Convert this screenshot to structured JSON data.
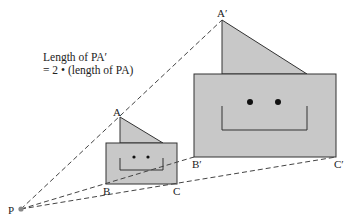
{
  "caption": {
    "line1": "Length of PA′",
    "line2": "= 2 • (length of PA)"
  },
  "labels": {
    "P": "P",
    "A": "A",
    "B": "B",
    "C": "C",
    "A_prime": "A′",
    "B_prime": "B′",
    "C_prime": "C′"
  },
  "scale_factor": 2,
  "colors": {
    "fill": "#c8c8c8",
    "stroke": "#333333",
    "dashed": "#444444",
    "center": "#888888"
  }
}
